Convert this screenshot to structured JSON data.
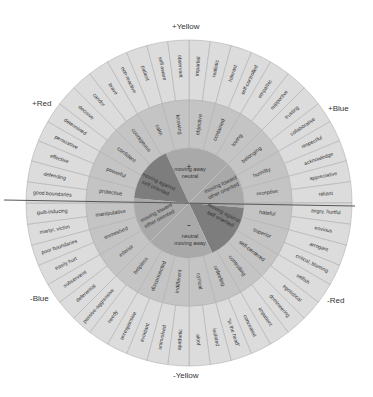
{
  "axis_labels": {
    "top": "+Yellow",
    "bottom": "-Yellow",
    "upper_left": "+Red",
    "upper_right": "+Blue",
    "lower_left": "-Blue",
    "lower_right": "-Red"
  },
  "colors": {
    "outer_ring": "#dcdcdc",
    "middle_ring": "#c4c4c4",
    "inner_light": "#a9a9a9",
    "inner_dark": "#7d7d7d",
    "divider": "#555555",
    "stroke": "#b0b0b0"
  },
  "center": {
    "plus_sign": "+",
    "minus_sign": "-",
    "sectors": [
      {
        "label1": "moving away",
        "label2": "neutral",
        "tone": "light"
      },
      {
        "label1": "moving toward",
        "label2": "other oriented",
        "tone": "light"
      },
      {
        "label1": "moving against",
        "label2": "self oriented",
        "tone": "dark"
      },
      {
        "label1": "neutral",
        "label2": "moving away",
        "tone": "light"
      },
      {
        "label1": "moving toward",
        "label2": "other oriented",
        "tone": "light"
      },
      {
        "label1": "moving against",
        "label2": "self oriented",
        "tone": "dark"
      }
    ]
  },
  "middle_ring": [
    "objective",
    "contained",
    "loving",
    "belonging",
    "humility",
    "receptive",
    "hateful",
    "superior",
    "self-centered",
    "controlling",
    "unfeeling",
    "cynical",
    "indifferent",
    "disconnected",
    "helpless",
    "inferior",
    "enmeshed",
    "manipulative",
    "protective",
    "powerful",
    "confident",
    "courageous",
    "calm",
    "knowing"
  ],
  "outer_ring": [
    "impartial",
    "realistic",
    "tolerant",
    "self-controlled",
    "empathic",
    "supportive",
    "trusting",
    "collaborative",
    "respectful",
    "acknowledge",
    "appreciative",
    "reliant",
    "angry, hurtful",
    "envious",
    "arrogant",
    "critical, blaming",
    "selfish",
    "egotistical",
    "domineering",
    "impatient",
    "concealed",
    "\"in the head\"",
    "isolated",
    "aloof",
    "apathetic",
    "uninvolved",
    "avoidant",
    "unresponsive",
    "needy",
    "passive-aggressive",
    "deferential",
    "subservient",
    "easily hurt",
    "poor boundaries",
    "martyr, victim",
    "guilt-inducing",
    "good boundaries",
    "defending",
    "effective",
    "persuasive",
    "determined",
    "decisive",
    "candor",
    "brave",
    "non-reactive",
    "patient",
    "self aware",
    "observant"
  ]
}
